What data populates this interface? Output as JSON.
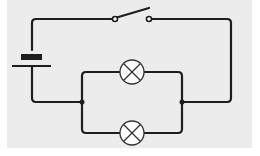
{
  "diagram": {
    "title": "",
    "type": "electric circuit",
    "colors": {
      "background": "#ececec",
      "wire": "#1e1e1e",
      "lamp_fill": "#ffffff",
      "lamp_stroke": "#333333"
    },
    "components": [
      {
        "id": "battery",
        "kind": "cell",
        "label": ""
      },
      {
        "id": "switch",
        "kind": "open-switch",
        "label": ""
      },
      {
        "id": "lamp-1",
        "kind": "lamp",
        "label": ""
      },
      {
        "id": "lamp-2",
        "kind": "lamp",
        "label": ""
      }
    ],
    "arrangement": "battery and switch in series with two lamps in parallel"
  }
}
